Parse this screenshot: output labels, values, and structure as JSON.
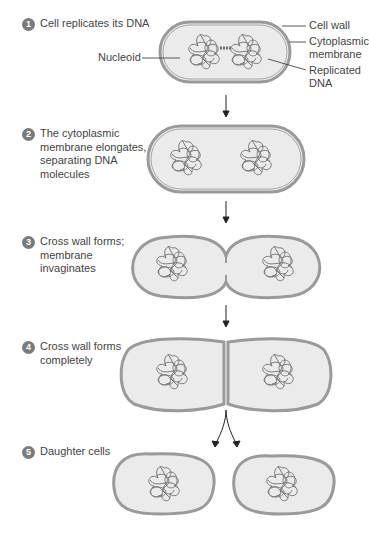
{
  "diagram": {
    "steps": [
      {
        "number": "1",
        "text": "Cell replicates its DNA"
      },
      {
        "number": "2",
        "text": "The cytoplasmic\nmembrane elongates,\nseparating DNA\nmolecules"
      },
      {
        "number": "3",
        "text": "Cross wall forms;\nmembrane\ninvaginates"
      },
      {
        "number": "4",
        "text": "Cross wall forms\ncompletely"
      },
      {
        "number": "5",
        "text": "Daughter cells"
      }
    ],
    "labels": {
      "cell_wall": "Cell wall",
      "cytoplasmic_membrane": "Cytoplasmic\nmembrane",
      "nucleoid": "Nucleoid",
      "replicated_dna": "Replicated\nDNA"
    },
    "colors": {
      "cell_fill": "#ebebeb",
      "cell_wall": "#9a9a9a",
      "membrane": "#777777",
      "dna": "#6e6e6e",
      "badge": "#7b7b7b",
      "arrow": "#222222"
    }
  }
}
